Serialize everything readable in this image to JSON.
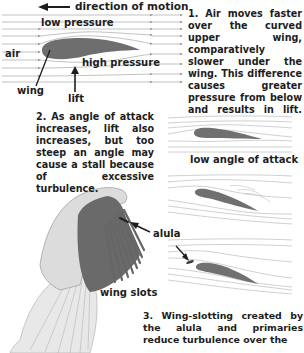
{
  "panel1": {
    "direction_label": "direction of motion",
    "low_pressure_label": "low pressure",
    "high_pressure_label": "high pressure",
    "air_label": "air",
    "wing_label": "wing",
    "lift_label": "lift",
    "caption": "1. Air moves faster over the curved upper wing, comparatively slower under the wing. This difference causes greater pressure from below and results in lift."
  },
  "panel2": {
    "caption": "2. As angle of attack increases, lift also increases, but too steep an angle may cause a stall because of excessive turbulence.",
    "low_angle_label": "low angle of attack"
  },
  "panel3": {
    "alula_label": "alula",
    "wing_slots_label": "wing slots",
    "caption": "3. Wing-slotting created by the alula and primaries reduce turbulence over the"
  },
  "colors": {
    "wing_fill": "#6e6e6e",
    "streamline": "#9a9a9a",
    "text": "#1d1d1d",
    "bird_light": "#d9d9d9",
    "bird_dark": "#6a6a6a"
  }
}
